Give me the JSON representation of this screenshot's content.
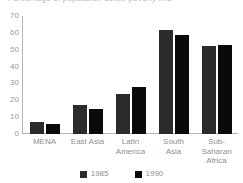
{
  "title": {
    "text": "Percentage of population below poverty line",
    "visible_fragment": true,
    "note_cropped": "cropped at top edge"
  },
  "chart_data": {
    "type": "bar",
    "title": "Percentage of population below poverty line",
    "xlabel": "",
    "ylabel": "",
    "ylim": [
      0,
      70
    ],
    "yticks": [
      0,
      10,
      20,
      30,
      40,
      50,
      60,
      70
    ],
    "grid": false,
    "legend_position": "bottom-center",
    "categories": [
      "MENA",
      "East Asia",
      "Latin America",
      "South Asia",
      "Sub-Saharan Africa"
    ],
    "category_lines": [
      [
        "MENA"
      ],
      [
        "East Asia"
      ],
      [
        "Latin",
        "America"
      ],
      [
        "South",
        "Asia"
      ],
      [
        "Sub-",
        "Saharan",
        "Africa"
      ]
    ],
    "series": [
      {
        "name": "1985",
        "color": "#2b2b2b",
        "values": [
          7,
          17,
          24,
          62,
          52
        ]
      },
      {
        "name": "1990",
        "color": "#0a0a0a",
        "values": [
          6,
          15,
          28,
          59,
          53
        ]
      }
    ]
  },
  "axis": {
    "line_color": "#b5b5b5",
    "tick_label_color": "#9a9a9a"
  },
  "legend": {
    "items": [
      {
        "label": "1985",
        "color": "#2b2b2b"
      },
      {
        "label": "1990",
        "color": "#0a0a0a"
      }
    ]
  }
}
